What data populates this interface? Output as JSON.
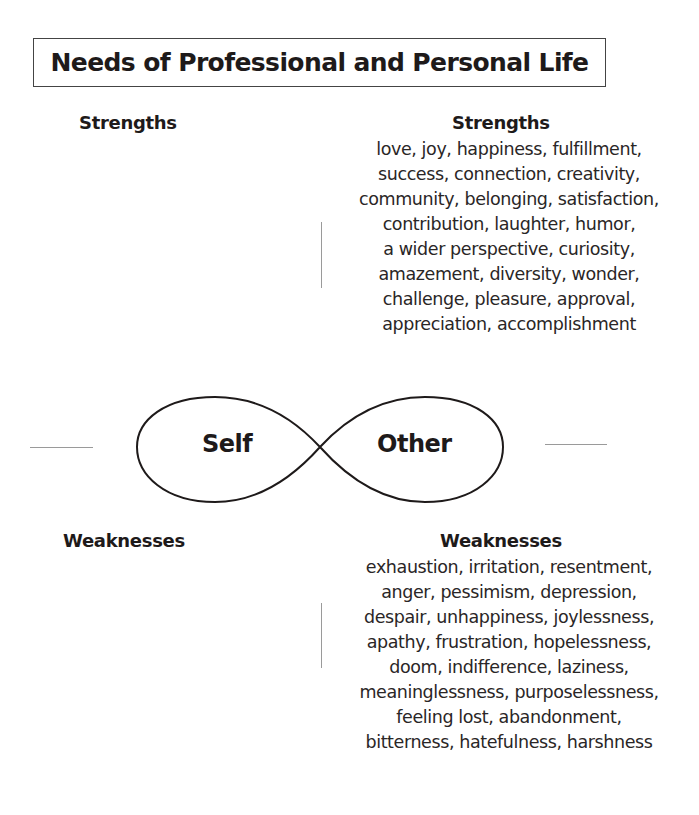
{
  "title": "Needs of Professional and Personal Life",
  "left": {
    "strengths_heading": "Strengths",
    "weaknesses_heading": "Weaknesses"
  },
  "right": {
    "strengths_heading": "Strengths",
    "strengths_lines": [
      "love, joy, happiness, fulfillment,",
      "success, connection, creativity,",
      "community, belonging, satisfaction,",
      "contribution, laughter, humor,",
      "a wider perspective, curiosity,",
      "amazement, diversity, wonder,",
      "challenge, pleasure, approval,",
      "appreciation, accomplishment"
    ],
    "weaknesses_heading": "Weaknesses",
    "weaknesses_lines": [
      "exhaustion, irritation, resentment,",
      "anger, pessimism, depression,",
      "despair, unhappiness, joylessness,",
      "apathy, frustration, hopelessness,",
      "doom, indifference, laziness,",
      "meaninglessness, purposelessness,",
      "feeling lost, abandonment,",
      "bitterness, hatefulness, harshness"
    ]
  },
  "diagram": {
    "shape": "infinity-loop",
    "left_loop_label": "Self",
    "right_loop_label": "Other"
  }
}
